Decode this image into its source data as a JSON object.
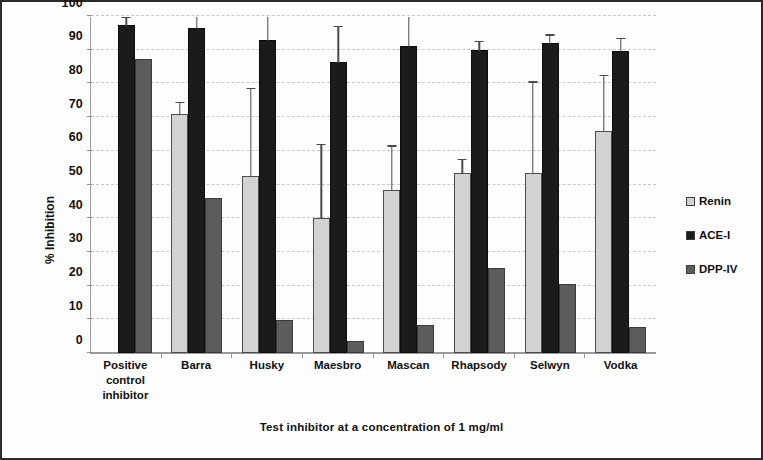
{
  "chart_data": {
    "type": "bar",
    "title": "",
    "xlabel": "Test inhibitor at a concentration of 1 mg/ml",
    "ylabel": "% Inhibition",
    "ylim": [
      0,
      100
    ],
    "ytick_step": 10,
    "yticks": [
      "100",
      "90",
      "80",
      "70",
      "60",
      "50",
      "40",
      "30",
      "20",
      "10",
      "0"
    ],
    "grid": true,
    "legend_position": "right",
    "categories": [
      "Positive\ncontrol\ninhibitor",
      "Barra",
      "Husky",
      "Maesbro",
      "Mascan",
      "Rhapsody",
      "Selwyn",
      "Vodka"
    ],
    "series": [
      {
        "name": "Renin",
        "color": "#d2d2d2",
        "values": [
          null,
          71.0,
          52.5,
          40.0,
          48.5,
          53.5,
          53.5,
          66.0
        ],
        "errors": [
          null,
          3.5,
          26.0,
          22.0,
          13.0,
          4.0,
          27.0,
          16.5
        ]
      },
      {
        "name": "ACE-I",
        "color": "#1b1b1b",
        "values": [
          97.3,
          96.5,
          92.8,
          86.5,
          91.0,
          90.0,
          92.0,
          89.5
        ],
        "errors": [
          2.3,
          3.5,
          7.2,
          10.5,
          9.0,
          2.5,
          2.5,
          4.0
        ]
      },
      {
        "name": "DPP-IV",
        "color": "#5c5c5c",
        "values": [
          87.3,
          46.0,
          9.8,
          3.5,
          8.3,
          25.3,
          20.5,
          7.8
        ]
      }
    ]
  },
  "legend": {
    "items": [
      {
        "label": "Renin",
        "color": "#d2d2d2"
      },
      {
        "label": "ACE-I",
        "color": "#1b1b1b"
      },
      {
        "label": "DPP-IV",
        "color": "#5c5c5c"
      }
    ]
  }
}
